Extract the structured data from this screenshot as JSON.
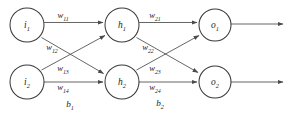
{
  "diagram": {
    "type": "neural-network-architecture",
    "title": "",
    "layers": [
      {
        "name": "input-layer",
        "nodes": [
          {
            "id": "i1",
            "base": "i",
            "sub": "1",
            "cx": 27,
            "cy": 25,
            "r": 17
          },
          {
            "id": "i2",
            "base": "i",
            "sub": "2",
            "cx": 27,
            "cy": 82,
            "r": 17
          }
        ]
      },
      {
        "name": "hidden-layer",
        "nodes": [
          {
            "id": "h1",
            "base": "h",
            "sub": "1",
            "cx": 122,
            "cy": 25,
            "r": 17
          },
          {
            "id": "h2",
            "base": "h",
            "sub": "2",
            "cx": 122,
            "cy": 82,
            "r": 17
          }
        ]
      },
      {
        "name": "output-layer",
        "nodes": [
          {
            "id": "o1",
            "base": "o",
            "sub": "1",
            "cx": 215,
            "cy": 25,
            "r": 16
          },
          {
            "id": "o2",
            "base": "o",
            "sub": "2",
            "cx": 215,
            "cy": 82,
            "r": 16
          }
        ]
      }
    ],
    "edges": [
      {
        "id": "e-i1-h1",
        "from": "i1",
        "to": "h1",
        "weight": "w11"
      },
      {
        "id": "e-i1-h2",
        "from": "i1",
        "to": "h2",
        "weight": "w12"
      },
      {
        "id": "e-i2-h1",
        "from": "i2",
        "to": "h1",
        "weight": "w13"
      },
      {
        "id": "e-i2-h2",
        "from": "i2",
        "to": "h2",
        "weight": "w14"
      },
      {
        "id": "e-h1-o1",
        "from": "h1",
        "to": "o1",
        "weight": "w21"
      },
      {
        "id": "e-h1-o2",
        "from": "h1",
        "to": "o2",
        "weight": "w22"
      },
      {
        "id": "e-h2-o1",
        "from": "h2",
        "to": "o1",
        "weight": "w23"
      },
      {
        "id": "e-h2-o2",
        "from": "h2",
        "to": "o2",
        "weight": "w24"
      },
      {
        "id": "e-o1-out",
        "from": "o1",
        "to": "edge-right",
        "weight": ""
      },
      {
        "id": "e-o2-out",
        "from": "o2",
        "to": "edge-right",
        "weight": ""
      }
    ],
    "weight_labels": [
      {
        "id": "w11",
        "base": "w",
        "sub": "11",
        "x": 63,
        "y": 16
      },
      {
        "id": "w12",
        "base": "w",
        "sub": "12",
        "x": 52,
        "y": 48
      },
      {
        "id": "w13",
        "base": "w",
        "sub": "13",
        "x": 63,
        "y": 69
      },
      {
        "id": "w14",
        "base": "w",
        "sub": "14",
        "x": 63,
        "y": 88
      },
      {
        "id": "w21",
        "base": "w",
        "sub": "21",
        "x": 155,
        "y": 16
      },
      {
        "id": "w22",
        "base": "w",
        "sub": "22",
        "x": 148,
        "y": 48
      },
      {
        "id": "w23",
        "base": "w",
        "sub": "23",
        "x": 155,
        "y": 69
      },
      {
        "id": "w24",
        "base": "w",
        "sub": "24",
        "x": 155,
        "y": 88
      }
    ],
    "bias_labels": [
      {
        "id": "b1",
        "base": "b",
        "sub": "1",
        "x": 70,
        "y": 105
      },
      {
        "id": "b2",
        "base": "b",
        "sub": "2",
        "x": 160,
        "y": 104
      }
    ],
    "colors": {
      "background": "#ffffff",
      "node_stroke": "#3a3a3a",
      "node_fill": "#ffffff",
      "edge_stroke": "#4a4a4a",
      "text": "#1d1d1d"
    }
  }
}
